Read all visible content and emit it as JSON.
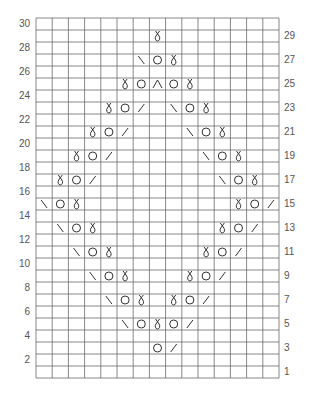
{
  "chart_data": {
    "type": "table",
    "columns": 15,
    "rows": 30,
    "row_labels_left": [
      30,
      28,
      26,
      24,
      22,
      20,
      18,
      16,
      14,
      12,
      10,
      8,
      6,
      4,
      2
    ],
    "row_labels_right": [
      29,
      27,
      25,
      23,
      21,
      19,
      17,
      15,
      13,
      11,
      9,
      7,
      5,
      3,
      1
    ],
    "legend": {
      "tbl": "twisted knit stitch (k1 tbl)",
      "yo": "yarn over (circle)",
      "k2tog": "right-leaning decrease (/)",
      "ssk": "left-leaning decrease (\\)",
      "cdd": "centered double decrease (^)"
    },
    "stitches": [
      {
        "row": 29,
        "cells": [
          {
            "col": 8,
            "sym": "tbl"
          }
        ]
      },
      {
        "row": 27,
        "cells": [
          {
            "col": 7,
            "sym": "ssk"
          },
          {
            "col": 8,
            "sym": "yo"
          },
          {
            "col": 9,
            "sym": "tbl"
          }
        ]
      },
      {
        "row": 25,
        "cells": [
          {
            "col": 6,
            "sym": "tbl"
          },
          {
            "col": 7,
            "sym": "yo"
          },
          {
            "col": 8,
            "sym": "cdd"
          },
          {
            "col": 9,
            "sym": "yo"
          },
          {
            "col": 10,
            "sym": "tbl"
          }
        ]
      },
      {
        "row": 23,
        "cells": [
          {
            "col": 5,
            "sym": "tbl"
          },
          {
            "col": 6,
            "sym": "yo"
          },
          {
            "col": 7,
            "sym": "k2tog"
          },
          {
            "col": 9,
            "sym": "ssk"
          },
          {
            "col": 10,
            "sym": "yo"
          },
          {
            "col": 11,
            "sym": "tbl"
          }
        ]
      },
      {
        "row": 21,
        "cells": [
          {
            "col": 4,
            "sym": "tbl"
          },
          {
            "col": 5,
            "sym": "yo"
          },
          {
            "col": 6,
            "sym": "k2tog"
          },
          {
            "col": 10,
            "sym": "ssk"
          },
          {
            "col": 11,
            "sym": "yo"
          },
          {
            "col": 12,
            "sym": "tbl"
          }
        ]
      },
      {
        "row": 19,
        "cells": [
          {
            "col": 3,
            "sym": "tbl"
          },
          {
            "col": 4,
            "sym": "yo"
          },
          {
            "col": 5,
            "sym": "k2tog"
          },
          {
            "col": 11,
            "sym": "ssk"
          },
          {
            "col": 12,
            "sym": "yo"
          },
          {
            "col": 13,
            "sym": "tbl"
          }
        ]
      },
      {
        "row": 17,
        "cells": [
          {
            "col": 2,
            "sym": "tbl"
          },
          {
            "col": 3,
            "sym": "yo"
          },
          {
            "col": 4,
            "sym": "k2tog"
          },
          {
            "col": 12,
            "sym": "ssk"
          },
          {
            "col": 13,
            "sym": "yo"
          },
          {
            "col": 14,
            "sym": "tbl"
          }
        ]
      },
      {
        "row": 15,
        "cells": [
          {
            "col": 1,
            "sym": "ssk"
          },
          {
            "col": 2,
            "sym": "yo"
          },
          {
            "col": 3,
            "sym": "tbl"
          },
          {
            "col": 13,
            "sym": "tbl"
          },
          {
            "col": 14,
            "sym": "yo"
          },
          {
            "col": 15,
            "sym": "k2tog"
          }
        ]
      },
      {
        "row": 13,
        "cells": [
          {
            "col": 2,
            "sym": "ssk"
          },
          {
            "col": 3,
            "sym": "yo"
          },
          {
            "col": 4,
            "sym": "tbl"
          },
          {
            "col": 12,
            "sym": "tbl"
          },
          {
            "col": 13,
            "sym": "yo"
          },
          {
            "col": 14,
            "sym": "k2tog"
          }
        ]
      },
      {
        "row": 11,
        "cells": [
          {
            "col": 3,
            "sym": "ssk"
          },
          {
            "col": 4,
            "sym": "yo"
          },
          {
            "col": 5,
            "sym": "tbl"
          },
          {
            "col": 11,
            "sym": "tbl"
          },
          {
            "col": 12,
            "sym": "yo"
          },
          {
            "col": 13,
            "sym": "k2tog"
          }
        ]
      },
      {
        "row": 9,
        "cells": [
          {
            "col": 4,
            "sym": "ssk"
          },
          {
            "col": 5,
            "sym": "yo"
          },
          {
            "col": 6,
            "sym": "tbl"
          },
          {
            "col": 10,
            "sym": "tbl"
          },
          {
            "col": 11,
            "sym": "yo"
          },
          {
            "col": 12,
            "sym": "k2tog"
          }
        ]
      },
      {
        "row": 7,
        "cells": [
          {
            "col": 5,
            "sym": "ssk"
          },
          {
            "col": 6,
            "sym": "yo"
          },
          {
            "col": 7,
            "sym": "tbl"
          },
          {
            "col": 9,
            "sym": "tbl"
          },
          {
            "col": 10,
            "sym": "yo"
          },
          {
            "col": 11,
            "sym": "k2tog"
          }
        ]
      },
      {
        "row": 5,
        "cells": [
          {
            "col": 6,
            "sym": "ssk"
          },
          {
            "col": 7,
            "sym": "yo"
          },
          {
            "col": 8,
            "sym": "tbl"
          },
          {
            "col": 9,
            "sym": "yo"
          },
          {
            "col": 10,
            "sym": "k2tog"
          }
        ]
      },
      {
        "row": 3,
        "cells": [
          {
            "col": 8,
            "sym": "yo"
          },
          {
            "col": 9,
            "sym": "k2tog"
          }
        ]
      }
    ],
    "colors": {
      "grid": "#6a6a6a",
      "symbol": "#333333",
      "label": "#555555"
    }
  },
  "labels": {
    "left": [
      "30",
      "28",
      "26",
      "24",
      "22",
      "20",
      "18",
      "16",
      "14",
      "12",
      "10",
      "8",
      "6",
      "4",
      "2"
    ],
    "right": [
      "29",
      "27",
      "25",
      "23",
      "21",
      "19",
      "17",
      "15",
      "13",
      "11",
      "9",
      "7",
      "5",
      "3",
      "1"
    ]
  }
}
